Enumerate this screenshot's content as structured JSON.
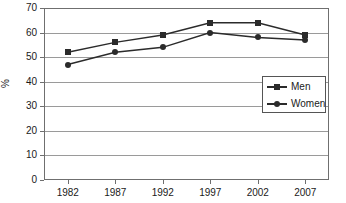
{
  "chart_data": {
    "type": "line",
    "title": "",
    "xlabel": "",
    "ylabel": "%",
    "categories": [
      "1982",
      "1987",
      "1992",
      "1997",
      "2002",
      "2007"
    ],
    "series": [
      {
        "name": "Men",
        "marker": "square",
        "color": "#2b2b2b",
        "values": [
          52,
          56,
          59,
          64,
          64,
          59
        ]
      },
      {
        "name": "Women",
        "marker": "circle",
        "color": "#2b2b2b",
        "values": [
          47,
          52,
          54,
          60,
          58,
          57
        ]
      }
    ],
    "ylim": [
      0,
      70
    ],
    "yticks": [
      0,
      10,
      20,
      30,
      40,
      50,
      60,
      70
    ],
    "ytick_labels": [
      "0",
      "10",
      "20",
      "30",
      "40",
      "50",
      "60",
      "70"
    ],
    "grid": "horizontal",
    "legend_position": "center-right",
    "legend_entries": [
      "Men",
      "Women"
    ]
  }
}
